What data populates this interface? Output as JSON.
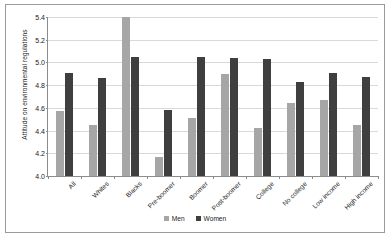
{
  "chart_data": {
    "type": "bar",
    "title": "",
    "xlabel": "",
    "ylabel": "Attitude on environmental regulations",
    "ylim": [
      4.0,
      5.4
    ],
    "ytick_step": 0.2,
    "yticks": [
      "4.0",
      "4.2",
      "4.4",
      "4.6",
      "4.8",
      "5.0",
      "5.2",
      "5.4"
    ],
    "grid": true,
    "legend_position": "bottom",
    "categories": [
      "All",
      "Whites",
      "Blacks",
      "Pre-boomer",
      "Boomer",
      "Post-boomer",
      "College",
      "No college",
      "Low income",
      "High income"
    ],
    "series": [
      {
        "name": "Men",
        "color": "#a6a6a6",
        "values": [
          4.57,
          4.45,
          5.4,
          4.17,
          4.51,
          4.9,
          4.42,
          4.64,
          4.67,
          4.45
        ]
      },
      {
        "name": "Women",
        "color": "#3f3f3f",
        "values": [
          4.91,
          4.86,
          5.05,
          4.58,
          5.05,
          5.04,
          5.03,
          4.83,
          4.91,
          4.87
        ]
      }
    ]
  }
}
